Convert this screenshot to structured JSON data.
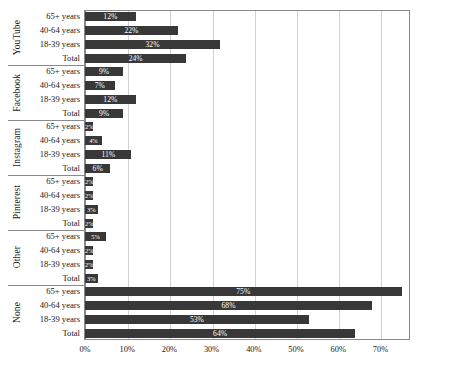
{
  "chart_data": {
    "type": "bar",
    "orientation": "horizontal",
    "title": "",
    "xlabel": "",
    "ylabel": "",
    "xlim": [
      0,
      77
    ],
    "xticks": [
      "0%",
      "10%",
      "20%",
      "30%",
      "40%",
      "50%",
      "60%",
      "70%"
    ],
    "xtick_values": [
      0,
      10,
      20,
      30,
      40,
      50,
      60,
      70
    ],
    "grid": true,
    "legend": "none",
    "bar_color": "#383838",
    "value_suffix": "%",
    "categories": [
      "65+ years",
      "40-64 years",
      "18-39 years",
      "Total"
    ],
    "groups": [
      {
        "name": "YouTube",
        "rows": [
          {
            "label": "65+ years",
            "value": 12,
            "text": "12%"
          },
          {
            "label": "40-64 years",
            "value": 22,
            "text": "22%"
          },
          {
            "label": "18-39 years",
            "value": 32,
            "text": "32%"
          },
          {
            "label": "Total",
            "value": 24,
            "text": "24%"
          }
        ]
      },
      {
        "name": "Facebook",
        "rows": [
          {
            "label": "65+ years",
            "value": 9,
            "text": "9%"
          },
          {
            "label": "40-64 years",
            "value": 7,
            "text": "7%"
          },
          {
            "label": "18-39 years",
            "value": 12,
            "text": "12%"
          },
          {
            "label": "Total",
            "value": 9,
            "text": "9%"
          }
        ]
      },
      {
        "name": "Instagram",
        "rows": [
          {
            "label": "65+ years",
            "value": 2,
            "text": "2%"
          },
          {
            "label": "40-64 years",
            "value": 4,
            "text": "4%"
          },
          {
            "label": "18-39 years",
            "value": 11,
            "text": "11%"
          },
          {
            "label": "Total",
            "value": 6,
            "text": "6%"
          }
        ]
      },
      {
        "name": "Pinterest",
        "rows": [
          {
            "label": "65+ years",
            "value": 2,
            "text": "2%"
          },
          {
            "label": "40-64 years",
            "value": 2,
            "text": "2%"
          },
          {
            "label": "18-39 years",
            "value": 3,
            "text": "3%"
          },
          {
            "label": "Total",
            "value": 2,
            "text": "2%"
          }
        ]
      },
      {
        "name": "Other",
        "rows": [
          {
            "label": "65+ years",
            "value": 5,
            "text": "5%"
          },
          {
            "label": "40-64 years",
            "value": 2,
            "text": "2%"
          },
          {
            "label": "18-39 years",
            "value": 2,
            "text": "2%"
          },
          {
            "label": "Total",
            "value": 3,
            "text": "3%"
          }
        ]
      },
      {
        "name": "None",
        "rows": [
          {
            "label": "65+ years",
            "value": 75,
            "text": "75%"
          },
          {
            "label": "40-64 years",
            "value": 68,
            "text": "68%"
          },
          {
            "label": "18-39 years",
            "value": 53,
            "text": "53%"
          },
          {
            "label": "Total",
            "value": 64,
            "text": "64%"
          }
        ]
      }
    ]
  }
}
